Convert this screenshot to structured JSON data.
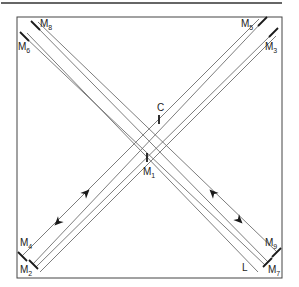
{
  "diagram": {
    "colors": {
      "beam": "#6e6e6e",
      "mirror": "#1a1a1a",
      "frame": "#444444",
      "rule": "#333333",
      "text": "#222222"
    },
    "top_rule": {
      "x1": 1,
      "y1": 3,
      "x2": 282,
      "y2": 3
    },
    "frame": {
      "x": 17,
      "y": 17,
      "w": 265,
      "h": 261
    },
    "labels": [
      {
        "id": "M8",
        "main": "M",
        "sub": "8",
        "x": 40,
        "y": 27
      },
      {
        "id": "M6",
        "main": "M",
        "sub": "6",
        "x": 18,
        "y": 50
      },
      {
        "id": "M5",
        "main": "M",
        "sub": "5",
        "x": 241,
        "y": 27
      },
      {
        "id": "M3",
        "main": "M",
        "sub": "3",
        "x": 265,
        "y": 50
      },
      {
        "id": "C",
        "main": "C",
        "sub": "",
        "x": 157,
        "y": 111
      },
      {
        "id": "M1",
        "main": "M",
        "sub": "1",
        "x": 143,
        "y": 175
      },
      {
        "id": "M4",
        "main": "M",
        "sub": "4",
        "x": 20,
        "y": 246
      },
      {
        "id": "M2",
        "main": "M",
        "sub": "2",
        "x": 20,
        "y": 273
      },
      {
        "id": "M9",
        "main": "M",
        "sub": "9",
        "x": 265,
        "y": 246
      },
      {
        "id": "M7",
        "main": "M",
        "sub": "7",
        "x": 268,
        "y": 273
      },
      {
        "id": "L",
        "main": "L",
        "sub": "",
        "x": 242,
        "y": 271
      }
    ],
    "beams": [
      {
        "name": "beam-m8-m7",
        "x1": 35,
        "y1": 25,
        "x2": 268,
        "y2": 262
      },
      {
        "name": "beam-m8-m9",
        "x1": 38,
        "y1": 22,
        "x2": 277,
        "y2": 252
      },
      {
        "name": "beam-m6-m7",
        "x1": 24,
        "y1": 36,
        "x2": 265,
        "y2": 265
      },
      {
        "name": "beam-m6-L",
        "x1": 27,
        "y1": 33,
        "x2": 258,
        "y2": 272
      },
      {
        "name": "beam-m5-m2",
        "x1": 262,
        "y1": 22,
        "x2": 33,
        "y2": 264
      },
      {
        "name": "beam-m5-m4",
        "x1": 259,
        "y1": 19,
        "x2": 22,
        "y2": 256
      },
      {
        "name": "beam-m3-m2",
        "x1": 273,
        "y1": 33,
        "x2": 36,
        "y2": 267
      },
      {
        "name": "beam-m3-out",
        "x1": 276,
        "y1": 36,
        "x2": 40,
        "y2": 272
      }
    ],
    "mirrors": [
      {
        "name": "mirror-m8",
        "x1": 31,
        "y1": 21,
        "x2": 40,
        "y2": 30
      },
      {
        "name": "mirror-m6",
        "x1": 20,
        "y1": 32,
        "x2": 29,
        "y2": 41
      },
      {
        "name": "mirror-m5",
        "x1": 258,
        "y1": 26,
        "x2": 267,
        "y2": 17
      },
      {
        "name": "mirror-m3",
        "x1": 269,
        "y1": 37,
        "x2": 278,
        "y2": 28
      },
      {
        "name": "mirror-m4",
        "x1": 18,
        "y1": 252,
        "x2": 27,
        "y2": 261
      },
      {
        "name": "mirror-m2",
        "x1": 29,
        "y1": 260,
        "x2": 38,
        "y2": 269
      },
      {
        "name": "mirror-m9",
        "x1": 272,
        "y1": 257,
        "x2": 281,
        "y2": 248
      },
      {
        "name": "mirror-m7",
        "x1": 263,
        "y1": 267,
        "x2": 272,
        "y2": 258
      },
      {
        "name": "mirror-c",
        "x1": 159,
        "y1": 115,
        "x2": 159,
        "y2": 124
      },
      {
        "name": "mirror-m1",
        "x1": 147,
        "y1": 153,
        "x2": 147,
        "y2": 162
      }
    ],
    "arrows": [
      {
        "name": "arrow-left-up",
        "x": 86,
        "y": 193,
        "angle": -45
      },
      {
        "name": "arrow-left-down",
        "x": 58,
        "y": 222,
        "angle": 135
      },
      {
        "name": "arrow-right-up",
        "x": 213,
        "y": 193,
        "angle": -135
      },
      {
        "name": "arrow-right-down",
        "x": 239,
        "y": 220,
        "angle": 45
      }
    ]
  }
}
